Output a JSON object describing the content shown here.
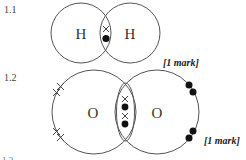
{
  "questions": [
    {
      "number": "1.1",
      "molecule": "H2",
      "atoms": [
        "H",
        "H"
      ],
      "shared_electrons": [
        {
          "type": "cross"
        },
        {
          "type": "dot"
        }
      ],
      "mark": "[1 mark]"
    },
    {
      "number": "1.2",
      "molecule": "O2",
      "atoms": [
        "O",
        "O"
      ],
      "shared_electrons": [
        {
          "type": "cross"
        },
        {
          "type": "dot"
        },
        {
          "type": "cross"
        },
        {
          "type": "dot"
        }
      ],
      "lone_electrons_left": [
        "cross",
        "cross",
        "cross",
        "cross"
      ],
      "lone_electrons_right": [
        "dot",
        "dot",
        "dot",
        "dot"
      ],
      "mark": "[1 mark]"
    }
  ],
  "partial_text": "1.3 ... ... ... ..."
}
